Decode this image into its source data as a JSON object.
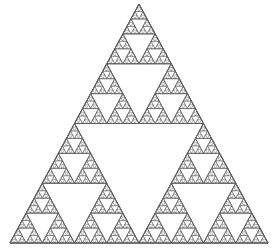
{
  "figure": {
    "type": "fractal",
    "background_color": "#ffffff",
    "stroke_color": "#5a5a5a",
    "stroke_width": 0.45,
    "fill": "none"
  },
  "chart_data": {
    "type": "line",
    "subtitle": "",
    "xlabel": "",
    "ylabel": "",
    "grid": false,
    "legend": "none",
    "tick_labels_x": [],
    "tick_labels_y": [],
    "annotations": [],
    "fractal": {
      "name": "Sierpinski gasket",
      "construction": "recursive-midpoint-subdivision",
      "recursion_depth": 6,
      "triangles_drawn": 1093,
      "smallest_triangles": 729,
      "outer_vertices": [
        {
          "label": "apex",
          "x": 139.0,
          "y": 4.0
        },
        {
          "label": "bottom-left",
          "x": 10.0,
          "y": 243.0
        },
        {
          "label": "bottom-right",
          "x": 268.0,
          "y": 243.0
        }
      ],
      "bounding_box": {
        "x": 10,
        "y": 4,
        "width": 258,
        "height": 239
      },
      "base_clusters_bottom_row": 8,
      "orientation": "apex-up"
    },
    "xlim": [
      0,
      273
    ],
    "ylim": [
      0,
      248
    ]
  }
}
